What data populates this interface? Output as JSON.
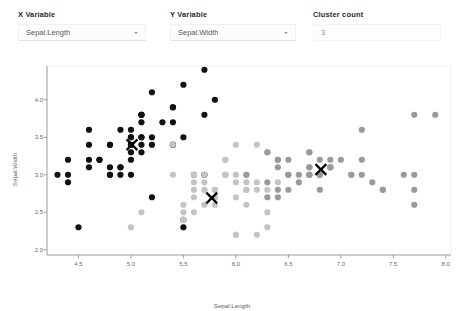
{
  "controls": [
    {
      "id": "x-variable",
      "label": "X Variable",
      "value": "Sepal.Length",
      "type": "select",
      "icon": "chevron-down-icon"
    },
    {
      "id": "y-variable",
      "label": "Y Variable",
      "value": "Sepal.Width",
      "type": "select",
      "icon": "chevron-down-icon"
    },
    {
      "id": "cluster-count",
      "label": "Cluster count",
      "value": "3",
      "type": "number",
      "icon": ""
    }
  ],
  "chart_data": {
    "type": "scatter",
    "title": "",
    "xlabel": "Sepal.Length",
    "ylabel": "Sepal.Width",
    "xlim": [
      4.2,
      8.05
    ],
    "ylim": [
      1.93,
      4.45
    ],
    "xticks": [
      "4.5",
      "5.0",
      "5.5",
      "6.0",
      "6.5",
      "7.0",
      "7.5",
      "8.0"
    ],
    "xtickvals": [
      4.5,
      5.0,
      5.5,
      6.0,
      6.5,
      7.0,
      7.5,
      8.0
    ],
    "yticks": [
      "2.0",
      "2.5",
      "3.0",
      "3.5",
      "4.0"
    ],
    "ytickvals": [
      2.0,
      2.5,
      3.0,
      3.5,
      4.0
    ],
    "grid": false,
    "legend": false,
    "point_radius": 3.1,
    "marker_color_centroid": "#000000",
    "series": [
      {
        "name": "cluster-1",
        "color": "#111111",
        "points": [
          [
            5.1,
            3.5
          ],
          [
            4.9,
            3.0
          ],
          [
            4.7,
            3.2
          ],
          [
            4.6,
            3.1
          ],
          [
            5.0,
            3.6
          ],
          [
            5.4,
            3.9
          ],
          [
            4.6,
            3.4
          ],
          [
            5.0,
            3.4
          ],
          [
            4.4,
            2.9
          ],
          [
            4.9,
            3.1
          ],
          [
            5.4,
            3.7
          ],
          [
            4.8,
            3.4
          ],
          [
            4.8,
            3.0
          ],
          [
            4.3,
            3.0
          ],
          [
            5.8,
            4.0
          ],
          [
            5.7,
            4.4
          ],
          [
            5.4,
            3.9
          ],
          [
            5.1,
            3.5
          ],
          [
            5.7,
            3.8
          ],
          [
            5.1,
            3.8
          ],
          [
            5.4,
            3.4
          ],
          [
            5.1,
            3.7
          ],
          [
            4.6,
            3.6
          ],
          [
            5.1,
            3.3
          ],
          [
            4.8,
            3.4
          ],
          [
            5.0,
            3.0
          ],
          [
            5.0,
            3.4
          ],
          [
            5.2,
            3.5
          ],
          [
            5.2,
            3.4
          ],
          [
            4.7,
            3.2
          ],
          [
            4.8,
            3.1
          ],
          [
            5.4,
            3.4
          ],
          [
            5.2,
            4.1
          ],
          [
            5.5,
            4.2
          ],
          [
            4.9,
            3.1
          ],
          [
            5.0,
            3.2
          ],
          [
            5.5,
            3.5
          ],
          [
            4.9,
            3.6
          ],
          [
            4.4,
            3.0
          ],
          [
            5.1,
            3.4
          ],
          [
            5.0,
            3.5
          ],
          [
            4.5,
            2.3
          ],
          [
            4.4,
            3.2
          ],
          [
            5.0,
            3.5
          ],
          [
            5.1,
            3.8
          ],
          [
            4.8,
            3.0
          ],
          [
            5.1,
            3.8
          ],
          [
            4.6,
            3.2
          ],
          [
            5.3,
            3.7
          ],
          [
            5.0,
            3.3
          ],
          [
            5.7,
            3.0
          ],
          [
            5.2,
            2.7
          ],
          [
            5.5,
            2.3
          ],
          [
            5.5,
            2.4
          ],
          [
            5.6,
            3.0
          ]
        ],
        "centroid": [
          5.01,
          3.4
        ]
      },
      {
        "name": "cluster-2",
        "color": "#c4c4c4",
        "points": [
          [
            5.5,
            2.6
          ],
          [
            5.7,
            2.8
          ],
          [
            5.5,
            2.4
          ],
          [
            5.8,
            2.7
          ],
          [
            6.0,
            2.2
          ],
          [
            5.4,
            3.0
          ],
          [
            6.0,
            3.4
          ],
          [
            5.6,
            2.5
          ],
          [
            5.6,
            2.9
          ],
          [
            5.7,
            2.6
          ],
          [
            5.5,
            2.5
          ],
          [
            5.8,
            2.6
          ],
          [
            5.0,
            2.3
          ],
          [
            5.6,
            2.7
          ],
          [
            5.7,
            3.0
          ],
          [
            5.7,
            2.9
          ],
          [
            6.2,
            2.9
          ],
          [
            5.1,
            2.5
          ],
          [
            5.7,
            2.8
          ],
          [
            5.8,
            2.7
          ],
          [
            6.0,
            2.9
          ],
          [
            5.6,
            3.0
          ],
          [
            5.8,
            2.8
          ],
          [
            6.1,
            2.8
          ],
          [
            6.3,
            2.5
          ],
          [
            6.1,
            3.0
          ],
          [
            5.9,
            3.2
          ],
          [
            6.0,
            2.7
          ],
          [
            6.1,
            2.9
          ],
          [
            5.6,
            3.0
          ],
          [
            6.2,
            2.2
          ],
          [
            5.9,
            3.0
          ],
          [
            6.1,
            2.6
          ],
          [
            6.3,
            2.3
          ],
          [
            5.8,
            2.7
          ],
          [
            5.9,
            3.2
          ],
          [
            6.0,
            2.2
          ],
          [
            5.4,
            3.4
          ],
          [
            6.3,
            2.8
          ],
          [
            5.6,
            2.8
          ],
          [
            6.2,
            2.8
          ],
          [
            5.9,
            3.0
          ],
          [
            5.8,
            2.8
          ],
          [
            6.0,
            3.0
          ],
          [
            6.4,
            2.9
          ],
          [
            6.3,
            3.3
          ],
          [
            6.1,
            2.8
          ],
          [
            6.2,
            3.4
          ],
          [
            5.9,
            3.0
          ],
          [
            5.5,
            2.4
          ]
        ],
        "centroid": [
          5.77,
          2.69
        ]
      },
      {
        "name": "cluster-3",
        "color": "#9a9a9a",
        "points": [
          [
            7.0,
            3.2
          ],
          [
            6.4,
            3.2
          ],
          [
            6.9,
            3.1
          ],
          [
            6.5,
            2.8
          ],
          [
            6.3,
            3.3
          ],
          [
            6.6,
            2.9
          ],
          [
            6.7,
            3.1
          ],
          [
            6.7,
            3.0
          ],
          [
            6.8,
            2.8
          ],
          [
            6.7,
            3.0
          ],
          [
            6.4,
            3.2
          ],
          [
            6.9,
            3.1
          ],
          [
            6.8,
            3.2
          ],
          [
            6.7,
            3.3
          ],
          [
            7.2,
            3.0
          ],
          [
            7.1,
            3.0
          ],
          [
            7.6,
            3.0
          ],
          [
            7.3,
            2.9
          ],
          [
            7.2,
            3.6
          ],
          [
            7.7,
            3.8
          ],
          [
            7.7,
            2.6
          ],
          [
            7.7,
            2.8
          ],
          [
            7.4,
            2.8
          ],
          [
            7.9,
            3.8
          ],
          [
            7.7,
            3.0
          ],
          [
            6.9,
            3.2
          ],
          [
            6.5,
            3.0
          ],
          [
            6.4,
            2.8
          ],
          [
            6.5,
            3.2
          ],
          [
            6.7,
            3.3
          ],
          [
            6.9,
            3.1
          ],
          [
            6.8,
            3.0
          ],
          [
            6.7,
            3.0
          ],
          [
            6.7,
            3.1
          ],
          [
            6.3,
            2.9
          ],
          [
            6.5,
            3.0
          ],
          [
            6.4,
            3.1
          ],
          [
            6.6,
            3.0
          ],
          [
            6.4,
            2.7
          ],
          [
            6.8,
            3.0
          ],
          [
            7.2,
            3.2
          ],
          [
            7.4,
            2.8
          ],
          [
            6.3,
            2.7
          ],
          [
            6.1,
            3.0
          ],
          [
            7.1,
            3.0
          ]
        ],
        "centroid": [
          6.81,
          3.07
        ]
      }
    ]
  }
}
